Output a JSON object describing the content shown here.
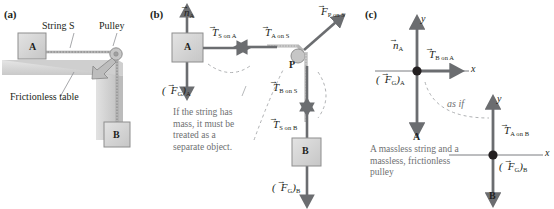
{
  "panels": {
    "a": {
      "label": "(a)",
      "block_a_label": "A",
      "block_b_label": "B",
      "string_label": "String S",
      "pulley_label": "Pulley",
      "table_label": "Frictionless table"
    },
    "b": {
      "label": "(b)",
      "block_a_label": "A",
      "block_b_label": "B",
      "pulley_label": "P",
      "normal_force_a": {
        "symbol": "n",
        "accent": "vector-arrow",
        "subscript": "A"
      },
      "gravity_a": {
        "symbol": "F",
        "accent": "vector-arrow",
        "subscript_inner": "G",
        "subscript_outer": "A",
        "display": "(F⃗G)A"
      },
      "tension_s_on_a": {
        "symbol": "T",
        "accent": "vector-arrow",
        "subscript": "S on A"
      },
      "tension_a_on_s": {
        "symbol": "T",
        "accent": "vector-arrow",
        "subscript": "A on S"
      },
      "force_p_on_s": {
        "symbol": "F",
        "accent": "vector-arrow",
        "subscript": "P on S"
      },
      "tension_b_on_s": {
        "symbol": "T",
        "accent": "vector-arrow",
        "subscript": "B on S"
      },
      "tension_s_on_b": {
        "symbol": "T",
        "accent": "vector-arrow",
        "subscript": "S on B"
      },
      "gravity_b": {
        "symbol": "F",
        "accent": "vector-arrow",
        "subscript_inner": "G",
        "subscript_outer": "B",
        "display": "(F⃗G)B"
      },
      "note": "If the string has\nmass, it must be\ntreated as a\nseparate object."
    },
    "c": {
      "label": "(c)",
      "axis_x_label": "x",
      "axis_y_label": "y",
      "object_a_label": "A",
      "object_b_label": "B",
      "normal_force_a": {
        "symbol": "n",
        "accent": "vector-arrow",
        "subscript": "A"
      },
      "gravity_a": {
        "symbol": "F",
        "accent": "vector-arrow",
        "subscript_inner": "G",
        "subscript_outer": "A",
        "display": "(F⃗G)A"
      },
      "tension_b_on_a": {
        "symbol": "T",
        "accent": "vector-arrow",
        "subscript": "B on A"
      },
      "tension_a_on_b": {
        "symbol": "T",
        "accent": "vector-arrow",
        "subscript": "A on B"
      },
      "gravity_b": {
        "symbol": "F",
        "accent": "vector-arrow",
        "subscript_inner": "G",
        "subscript_outer": "B",
        "display": "(F⃗G)B"
      },
      "as_if_label": "as if",
      "caption": "A massless string and a\nmassless, frictionless\npulley"
    }
  },
  "colors": {
    "arrow": "#6b6d70",
    "block_fill": "#d4d4d4",
    "block_stroke": "#8a8a8a",
    "table_fill": "#d9d9d9",
    "axis": "#7b7d80",
    "text": "#231f20",
    "gray_text": "#6e6f71",
    "dashed": "#9a9c9e"
  }
}
